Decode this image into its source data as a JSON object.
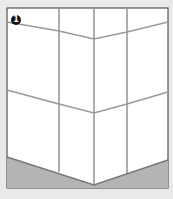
{
  "illustration": {
    "subject": "tiled wall corner",
    "step_badge": "1",
    "colors": {
      "background": "#e9e9e9",
      "tile": "#ffffff",
      "grout": "#9a9a9a",
      "floor": "#b4b4b4",
      "frame": "#555555"
    }
  }
}
